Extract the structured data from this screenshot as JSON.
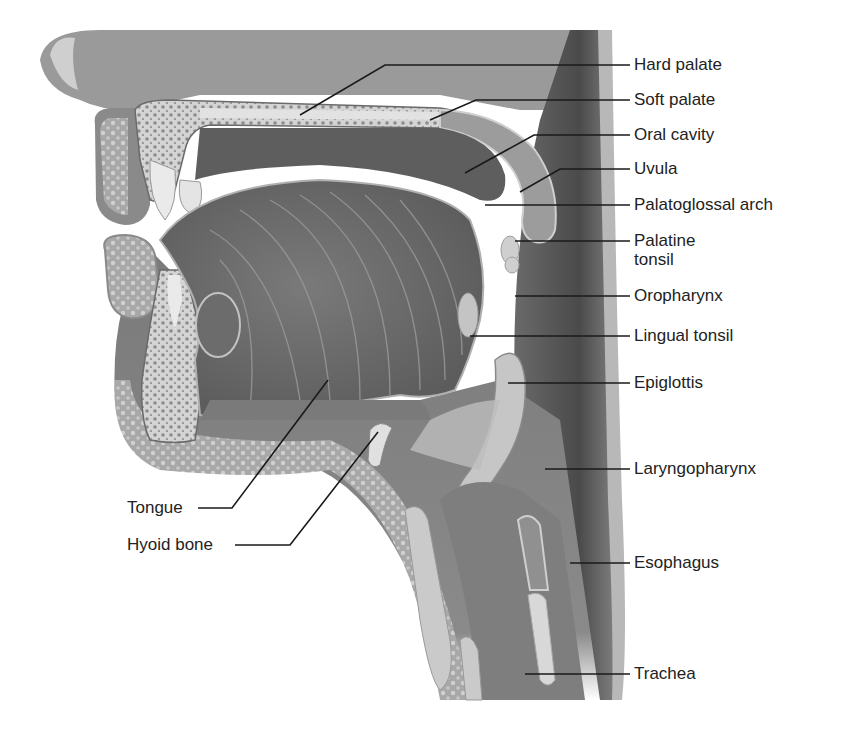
{
  "figure": {
    "style": "grayscale medical illustration"
  },
  "labels": {
    "hard_palate": "Hard palate",
    "soft_palate": "Soft palate",
    "oral_cavity": "Oral cavity",
    "uvula": "Uvula",
    "palatoglossal_arch": "Palatoglossal arch",
    "palatine_tonsil": "Palatine\ntonsil",
    "oropharynx": "Oropharynx",
    "lingual_tonsil": "Lingual tonsil",
    "epiglottis": "Epiglottis",
    "laryngopharynx": "Laryngopharynx",
    "esophagus": "Esophagus",
    "trachea": "Trachea",
    "tongue": "Tongue",
    "hyoid_bone": "Hyoid bone"
  },
  "colors": {
    "background": "#ffffff",
    "leader_line": "#1a1a1a",
    "label_text": "#222222",
    "tissue_dark": "#5a5a5a",
    "tissue_mid": "#8a8a8a",
    "tissue_light": "#b8b8b8",
    "bone": "#d6d6d6"
  }
}
